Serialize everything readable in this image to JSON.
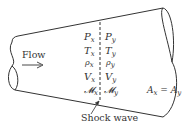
{
  "diagram": {
    "flow_label": "Flow",
    "shock_label": "Shock wave",
    "area_label": "A",
    "area_sub_x": "x",
    "area_eq": " = ",
    "area_sub_y": "y",
    "upstream": [
      {
        "sym": "P",
        "sub": "x"
      },
      {
        "sym": "T",
        "sub": "x"
      },
      {
        "sym": "ρ",
        "sub": "x"
      },
      {
        "sym": "V",
        "sub": "x"
      },
      {
        "sym": "𝓜",
        "sub": "x"
      }
    ],
    "downstream": [
      {
        "sym": "P",
        "sub": "y"
      },
      {
        "sym": "T",
        "sub": "y"
      },
      {
        "sym": "ρ",
        "sub": "y"
      },
      {
        "sym": "V",
        "sub": "y"
      },
      {
        "sym": "𝓜",
        "sub": "y"
      }
    ],
    "colors": {
      "stroke": "#333333",
      "background": "#ffffff"
    }
  }
}
